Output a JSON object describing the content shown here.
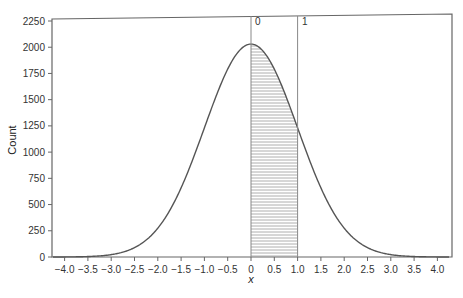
{
  "chart_data": {
    "type": "area",
    "title": "",
    "xlabel": "x",
    "ylabel": "Count",
    "xlim": [
      -4.3,
      4.3
    ],
    "ylim": [
      0,
      2250
    ],
    "grid": false,
    "legend": null,
    "x_ticks": [
      -4.0,
      -3.5,
      -3.0,
      -2.5,
      -2.0,
      -1.5,
      -1.0,
      -0.5,
      0,
      0.5,
      1.0,
      1.5,
      2.0,
      2.5,
      3.0,
      3.5,
      4.0
    ],
    "x_tick_labels": [
      "−4.0",
      "−3.5",
      "−3.0",
      "−2.5",
      "−2.0",
      "−1.5",
      "−1.0",
      "−0.5",
      "0",
      "0.5",
      "1.0",
      "1.5",
      "2.0",
      "2.5",
      "3.0",
      "3.5",
      "4.0"
    ],
    "y_ticks": [
      0,
      250,
      500,
      750,
      1000,
      1250,
      1500,
      1750,
      2000,
      2250
    ],
    "y_tick_labels": [
      "0",
      "250",
      "500",
      "750",
      "1000",
      "1250",
      "1500",
      "1750",
      "2000",
      "2250"
    ],
    "curve": {
      "name": "normal density (scaled)",
      "mean": 0,
      "sd": 1,
      "peak": 2030,
      "x": [
        -4.0,
        -3.5,
        -3.0,
        -2.5,
        -2.0,
        -1.5,
        -1.0,
        -0.5,
        0,
        0.5,
        1.0,
        1.5,
        2.0,
        2.5,
        3.0,
        3.5,
        4.0
      ],
      "y": [
        1,
        4,
        23,
        89,
        275,
        660,
        1231,
        1791,
        2030,
        1791,
        1231,
        660,
        275,
        89,
        23,
        4,
        1
      ]
    },
    "shaded_region": {
      "from": 0,
      "to": 1,
      "pattern": "horizontal-hatch"
    },
    "annotations": [
      {
        "text": "0",
        "x": 0,
        "position": "top",
        "type": "vertical-line"
      },
      {
        "text": "1",
        "x": 1,
        "position": "top",
        "type": "vertical-line"
      }
    ]
  },
  "labels": {
    "ylabel": "Count",
    "xlabel": "x",
    "marker_0": "0",
    "marker_1": "1"
  }
}
